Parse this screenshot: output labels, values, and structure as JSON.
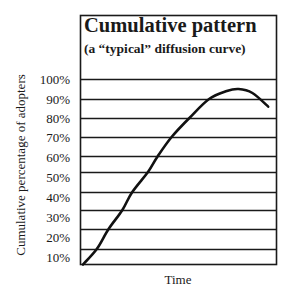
{
  "chart_data": {
    "type": "line",
    "title": "Cumulative pattern",
    "subtitle": "(a “typical” diffusion curve)",
    "xlabel": "Time",
    "ylabel": "Cumulative percentage of adopters",
    "y_tick_labels": [
      "100%",
      "90%",
      "80%",
      "70%",
      "60%",
      "50%",
      "40%",
      "30%",
      "20%",
      "10%"
    ],
    "ylim": [
      0,
      100
    ],
    "x_ticks_shown": false,
    "grid": "horizontal",
    "legend": "none",
    "series": [
      {
        "name": "Cumulative adopters",
        "x": [
          0,
          0.7,
          1.3,
          2.0,
          2.5,
          3.3,
          3.8,
          4.5,
          5.4,
          6.4,
          7.3,
          7.9,
          8.6,
          9.4
        ],
        "values": [
          0,
          10,
          20,
          30,
          40,
          50,
          60,
          70,
          80,
          90,
          94,
          95,
          93,
          86
        ]
      }
    ]
  },
  "labels": {
    "title": "Cumulative pattern",
    "subtitle": "(a “typical” diffusion curve)",
    "ylabel": "Cumulative percentage of adopters",
    "xlabel": "Time",
    "yticks": [
      "100%",
      "90%",
      "80%",
      "70%",
      "60%",
      "50%",
      "40%",
      "30%",
      "20%",
      "10%"
    ]
  }
}
